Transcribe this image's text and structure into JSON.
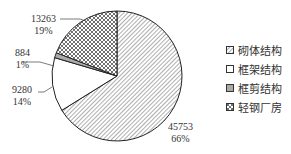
{
  "chart_data": {
    "type": "pie",
    "title": "",
    "categories": [
      "砌体结构",
      "框架结构",
      "框剪结构",
      "轻钢厂房"
    ],
    "values": [
      45753,
      9280,
      884,
      13263
    ],
    "percent_labels": [
      "66%",
      "14%",
      "1%",
      "19%"
    ],
    "value_labels": [
      "45753",
      "9280",
      "884",
      "13263"
    ],
    "fills": [
      "diagonal-hatch",
      "white",
      "gray",
      "crosshatch"
    ],
    "legend_position": "right",
    "start_angle": "12 o'clock, clockwise"
  },
  "labels": [
    {
      "value": "45753",
      "pct": "66%"
    },
    {
      "value": "9280",
      "pct": "14%"
    },
    {
      "value": "884",
      "pct": "1%"
    },
    {
      "value": "13263",
      "pct": "19%"
    }
  ],
  "legend": [
    {
      "label": "砌体结构"
    },
    {
      "label": "框架结构"
    },
    {
      "label": "框剪结构"
    },
    {
      "label": "轻钢厂房"
    }
  ]
}
